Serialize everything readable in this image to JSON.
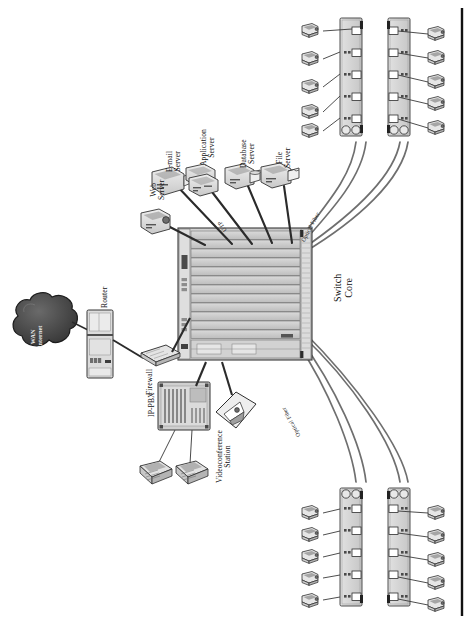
{
  "figure": {
    "orientation": "rotated-90-ccw",
    "background": "#ffffff",
    "border_rule_color": "#111111"
  },
  "palette": {
    "device_fill": "#d9d9d9",
    "device_fill_light": "#ededed",
    "device_stroke": "#3a3a3a",
    "chassis_fill": "#cfcfcf",
    "chassis_slot": "#c4c4c4",
    "cloud_fill": "#4a4a4a",
    "cloud_stroke": "#1e1e1e",
    "link_copper": "#2b2b2b",
    "link_fiber": "#6f6f6f",
    "label_text": "#111111"
  },
  "labels": {
    "wan_cloud": "WAN\nInternet",
    "router": "Router",
    "firewall": "Firewall",
    "ip_pbx": "IP-PBX",
    "videoconference": "Videoconference\nStation",
    "web_server": "Web\nServer",
    "email_server": "E-mail\nServer",
    "application_server": "Application\nServer",
    "database_server": "Database\nServer",
    "file_server": "File\nServer",
    "switch_core": "Switch\nCore",
    "optical_fiber_top": "Optical Fiber",
    "optical_fiber_bottom": "Optical Fiber",
    "utp": "UTP"
  },
  "core": {
    "name": "Switch Core",
    "label": "Switch\nCore",
    "type": "modular-chassis",
    "line_card_slots": 12,
    "lower_module_bays": 3,
    "supervisor_bays": 2
  },
  "edge_switches": [
    {
      "id": "sw-top-left",
      "group": "top",
      "ports": 5,
      "uplinks": 2,
      "media": "Optical Fiber",
      "workstations": 5,
      "ws_side": "left"
    },
    {
      "id": "sw-top-right",
      "group": "top",
      "ports": 5,
      "uplinks": 2,
      "media": "Optical Fiber",
      "workstations": 5,
      "ws_side": "right"
    },
    {
      "id": "sw-bot-left",
      "group": "bottom",
      "ports": 5,
      "uplinks": 2,
      "media": "Optical Fiber",
      "workstations": 5,
      "ws_side": "left"
    },
    {
      "id": "sw-bot-right",
      "group": "bottom",
      "ports": 5,
      "uplinks": 2,
      "media": "Optical Fiber",
      "workstations": 5,
      "ws_side": "right"
    }
  ],
  "servers": [
    {
      "id": "web",
      "label": "Web\nServer",
      "icon": "server-icon"
    },
    {
      "id": "email",
      "label": "E-mail\nServer",
      "icon": "server-icon"
    },
    {
      "id": "app",
      "label": "Application\nServer",
      "icon": "server-stack-icon"
    },
    {
      "id": "database",
      "label": "Database\nServer",
      "icon": "database-server-icon"
    },
    {
      "id": "file",
      "label": "File\nServer",
      "icon": "file-server-icon"
    }
  ],
  "voice": {
    "pbx_label": "IP-PBX",
    "ip_phones": 2,
    "videoconference_label": "Videoconference\nStation"
  },
  "edge_devices": {
    "router_label": "Router",
    "firewall_label": "Firewall",
    "cloud_label": "WAN\nInternet"
  },
  "link_types": {
    "copper": "UTP",
    "fiber": "Optical Fiber"
  },
  "counts": {
    "total_workstations": 20,
    "total_edge_switches": 4,
    "total_servers": 5,
    "total_ip_phones": 2
  }
}
